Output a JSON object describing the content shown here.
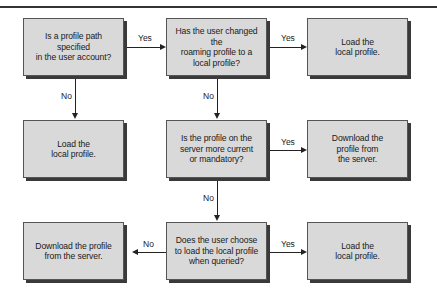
{
  "diagram": {
    "type": "flowchart",
    "nodes": [
      {
        "id": "q1",
        "text": "Is a profile path specified\nin the user account?"
      },
      {
        "id": "q2",
        "text": "Has the user changed the\nroaming profile to a\nlocal profile?"
      },
      {
        "id": "a1",
        "text": "Load the\nlocal profile."
      },
      {
        "id": "a2",
        "text": "Load the\nlocal profile."
      },
      {
        "id": "q3",
        "text": "Is the profile on the\nserver more current\nor mandatory?"
      },
      {
        "id": "a3",
        "text": "Download the\nprofile from\nthe server."
      },
      {
        "id": "a4",
        "text": "Download the profile\nfrom the server."
      },
      {
        "id": "q4",
        "text": "Does the user choose\nto load the local profile\nwhen queried?"
      },
      {
        "id": "a5",
        "text": "Load the\nlocal profile."
      }
    ],
    "edges": [
      {
        "from": "q1",
        "to": "q2",
        "label": "Yes"
      },
      {
        "from": "q1",
        "to": "a2",
        "label": "No"
      },
      {
        "from": "q2",
        "to": "a1",
        "label": "Yes"
      },
      {
        "from": "q2",
        "to": "q3",
        "label": "No"
      },
      {
        "from": "q3",
        "to": "a3",
        "label": "Yes"
      },
      {
        "from": "q3",
        "to": "q4",
        "label": "No"
      },
      {
        "from": "q4",
        "to": "a5",
        "label": "Yes"
      },
      {
        "from": "q4",
        "to": "a4",
        "label": "No"
      }
    ]
  },
  "labels": {
    "yes": "Yes",
    "no": "No"
  },
  "colors": {
    "box_fill": "#d9d9d9",
    "shadow": "#3a3a3a",
    "line": "#222222"
  }
}
